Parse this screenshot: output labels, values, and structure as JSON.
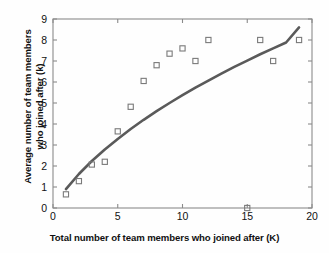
{
  "chart_data": {
    "type": "scatter",
    "title": "",
    "xlabel": "Total number of team members who joined after (K)",
    "ylabel_line1": "Average number of team members",
    "ylabel_line2": "who joined after (k)",
    "xlim": [
      0,
      20
    ],
    "ylim": [
      0,
      9
    ],
    "xticks": [
      0,
      5,
      10,
      15,
      20
    ],
    "yticks": [
      0,
      1,
      2,
      3,
      4,
      5,
      6,
      7,
      8,
      9
    ],
    "grid": false,
    "legend": null,
    "marker": "open-square",
    "marker_color": "#7a7a7a",
    "line_color": "#5a5a5a",
    "axis_color": "#8a8a8a",
    "series": [
      {
        "name": "Average members joined after K",
        "type": "scatter",
        "x": [
          1,
          2,
          3,
          4,
          5,
          6,
          7,
          8,
          9,
          10,
          11,
          12,
          15,
          16,
          17,
          19
        ],
        "y": [
          0.65,
          1.28,
          2.07,
          2.2,
          3.65,
          4.82,
          6.05,
          6.8,
          7.35,
          7.6,
          7.0,
          8.0,
          0.0,
          8.0,
          7.0,
          8.0
        ]
      },
      {
        "name": "Fitted trend curve",
        "type": "line",
        "x": [
          1,
          2,
          3,
          4,
          5,
          6,
          7,
          8,
          9,
          10,
          11,
          12,
          13,
          14,
          15,
          16,
          17,
          18,
          19
        ],
        "y": [
          0.9,
          1.62,
          2.24,
          2.79,
          3.29,
          3.76,
          4.2,
          4.61,
          5.0,
          5.37,
          5.73,
          6.07,
          6.4,
          6.72,
          7.02,
          7.32,
          7.6,
          7.88,
          8.6
        ]
      }
    ]
  },
  "axes": {
    "x_tick_labels": [
      "0",
      "5",
      "10",
      "15",
      "20"
    ],
    "y_tick_labels": [
      "0",
      "1",
      "2",
      "3",
      "4",
      "5",
      "6",
      "7",
      "8",
      "9"
    ]
  }
}
